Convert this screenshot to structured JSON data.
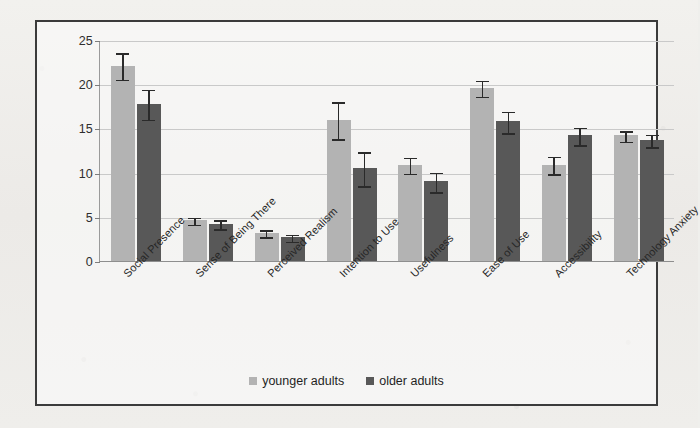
{
  "chart_data": {
    "type": "bar",
    "title": "",
    "subtitle": "",
    "xlabel": "",
    "ylabel": "",
    "ylim": [
      0,
      25
    ],
    "yticks": [
      0,
      5,
      10,
      15,
      20,
      25
    ],
    "grid": true,
    "legend_position": "bottom-center",
    "categories": [
      "Social Presence",
      "Sense of Being There",
      "Perceived Realism",
      "Intention to Use",
      "Usefulness",
      "Ease of Use",
      "Accessibility",
      "Technology Anxiety"
    ],
    "series": [
      {
        "name": "younger adults",
        "color": "#b3b3b3",
        "values": [
          22.1,
          4.6,
          3.2,
          16.0,
          10.9,
          19.6,
          10.9,
          14.2
        ],
        "errors": [
          1.5,
          0.4,
          0.4,
          2.1,
          0.9,
          0.9,
          1.0,
          0.6
        ]
      },
      {
        "name": "older adults",
        "color": "#585858",
        "values": [
          17.8,
          4.2,
          2.7,
          10.5,
          9.0,
          15.8,
          14.2,
          13.7
        ],
        "errors": [
          1.7,
          0.5,
          0.4,
          1.9,
          1.1,
          1.2,
          1.0,
          0.7
        ]
      }
    ]
  },
  "legend": {
    "items": [
      {
        "label": "younger adults",
        "color": "#b3b3b3"
      },
      {
        "label": "older adults",
        "color": "#585858"
      }
    ]
  }
}
